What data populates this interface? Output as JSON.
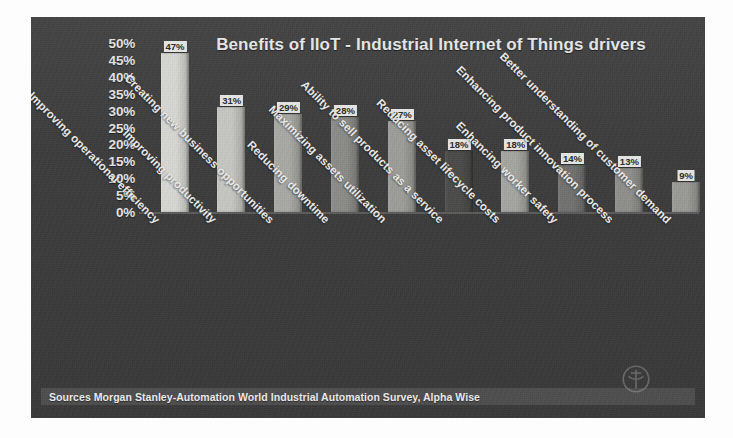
{
  "chart_data": {
    "type": "bar",
    "title": "Benefits of IIoT - Industrial Internet of Things drivers",
    "xlabel": "",
    "ylabel": "",
    "ylim": [
      0,
      50
    ],
    "grid": false,
    "legend": "none",
    "y_tick_labels": [
      "50%",
      "45%",
      "40%",
      "35%",
      "30%",
      "25%",
      "20%",
      "15%",
      "10%",
      "5%",
      "0%"
    ],
    "y_tick_values": [
      50,
      45,
      40,
      35,
      30,
      25,
      20,
      15,
      10,
      5,
      0
    ],
    "categories": [
      "Improving operational efficiency",
      "Improving productivity",
      "Creating new business opportunities",
      "Reducing downtime",
      "Maximizing assets utilization",
      "Ability to sell products as a service",
      "Reducing asset lifecycle costs",
      "Enhancing worker safety",
      "Enhancing product innovation process",
      "Better understanding of customer demand"
    ],
    "values": [
      47,
      31,
      29,
      28,
      27,
      18,
      18,
      14,
      13,
      9
    ],
    "data_labels": [
      "47%",
      "31%",
      "29%",
      "28%",
      "27%",
      "18%",
      "18%",
      "14%",
      "13%",
      "9%"
    ],
    "bar_colors": [
      "#d8d8d4",
      "#c7c7c3",
      "#a9a9a5",
      "#8b8b88",
      "#9d9d99",
      "#4a4a48",
      "#a5a5a1",
      "#717170",
      "#8f8f8c",
      "#9a9a97"
    ],
    "annotations": [
      "Sources Morgan Stanley-Automation World Industrial Automation Survey, Alpha Wise"
    ]
  },
  "panel": {
    "background_color": "#3b3b3b",
    "source_note": "Sources Morgan Stanley-Automation World Industrial Automation Survey, Alpha Wise",
    "watermark_name": "circular-logo-watermark"
  }
}
